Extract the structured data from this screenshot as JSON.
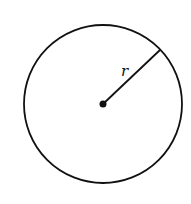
{
  "diagram": {
    "type": "circle-with-radius",
    "radius_label": "r",
    "stroke_color": "#111111",
    "background": "#ffffff"
  }
}
